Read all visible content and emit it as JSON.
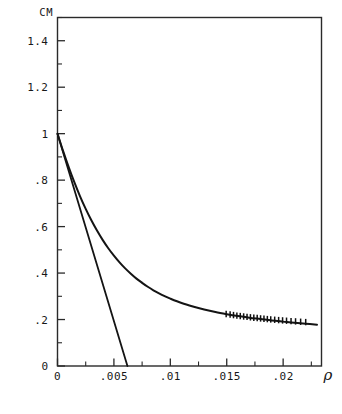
{
  "chart_data": {
    "type": "line",
    "title": "",
    "subtitle": "",
    "ylabel": "CM",
    "xlabel": "ρ",
    "xlim": [
      0,
      0.0234
    ],
    "ylim": [
      0,
      1.5
    ],
    "grid": false,
    "legend_position": "none",
    "x_ticks": [
      0,
      0.005,
      0.01,
      0.015,
      0.02
    ],
    "x_tick_labels": [
      "0",
      ".005",
      ".01",
      ".015",
      ".02"
    ],
    "x_minor_ticks": [
      0.0025,
      0.0075,
      0.0125,
      0.0175,
      0.0225
    ],
    "y_ticks": [
      0,
      0.2,
      0.4,
      0.6,
      0.8,
      1,
      1.2,
      1.4
    ],
    "y_tick_labels": [
      "0",
      ".2",
      ".4",
      ".6",
      ".8",
      "1",
      "1.2",
      "1.4"
    ],
    "y_minor_ticks": [
      0.1,
      0.3,
      0.5,
      0.7,
      0.9,
      1.1,
      1.3,
      1.5
    ],
    "series": [
      {
        "name": "decay-curve",
        "style": "solid",
        "x": [
          0.0,
          0.0005,
          0.001,
          0.0015,
          0.002,
          0.0025,
          0.003,
          0.0035,
          0.004,
          0.0045,
          0.005,
          0.0055,
          0.006,
          0.0065,
          0.007,
          0.0075,
          0.008,
          0.0085,
          0.009,
          0.0095,
          0.01,
          0.011,
          0.012,
          0.013,
          0.014,
          0.015,
          0.016,
          0.017,
          0.018,
          0.019,
          0.02,
          0.021,
          0.022,
          0.023
        ],
        "y": [
          1.0,
          0.925,
          0.855,
          0.79,
          0.73,
          0.676,
          0.627,
          0.583,
          0.543,
          0.507,
          0.475,
          0.446,
          0.42,
          0.397,
          0.376,
          0.358,
          0.341,
          0.326,
          0.313,
          0.301,
          0.29,
          0.271,
          0.256,
          0.243,
          0.232,
          0.223,
          0.215,
          0.208,
          0.202,
          0.196,
          0.191,
          0.186,
          0.182,
          0.178
        ]
      },
      {
        "name": "tangent-line",
        "style": "solid",
        "x": [
          0.0,
          0.0062
        ],
        "y": [
          1.0,
          0.0
        ]
      }
    ],
    "data_points": {
      "name": "measured-points",
      "marker": "vertical-tick",
      "x": [
        0.01495,
        0.0153,
        0.0156,
        0.0159,
        0.0162,
        0.0165,
        0.0168,
        0.0171,
        0.0174,
        0.0177,
        0.018,
        0.0183,
        0.0186,
        0.0189,
        0.01925,
        0.0196,
        0.01995,
        0.0203,
        0.0207,
        0.0211,
        0.02155,
        0.022
      ],
      "y": [
        0.224,
        0.2215,
        0.2192,
        0.217,
        0.215,
        0.2131,
        0.2113,
        0.2096,
        0.2079,
        0.2063,
        0.2048,
        0.2033,
        0.2019,
        0.2005,
        0.199,
        0.1976,
        0.1962,
        0.1948,
        0.1933,
        0.1919,
        0.1904,
        0.189
      ]
    },
    "colors": {
      "curve": "#141414",
      "axis": "#2a2a2a",
      "background": "#ffffff",
      "text": "#181818"
    }
  }
}
